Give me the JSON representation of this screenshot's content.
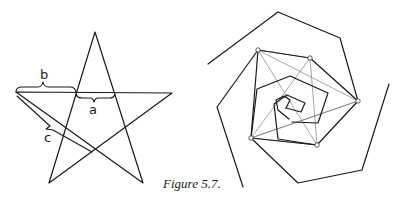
{
  "figure": {
    "caption": "Figure 5.7."
  },
  "pentagram": {
    "labels": {
      "a": "a",
      "b": "b",
      "c": "c"
    }
  },
  "spiral": {
    "description": "Hexagonal spirals with inscribed star of connecting lines"
  }
}
